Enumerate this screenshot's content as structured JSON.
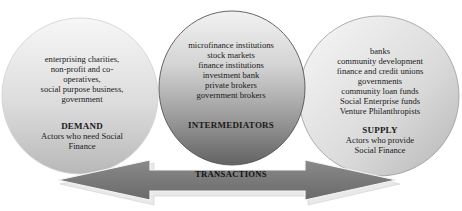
{
  "diagram": {
    "demand": {
      "items": [
        "enterprising charities,",
        "non-profit and co-",
        "operatives,",
        "social purpose business,",
        "government"
      ],
      "title": "DEMAND",
      "subtitle_lines": [
        "Actors who need Social",
        "Finance"
      ]
    },
    "intermediators": {
      "items": [
        "microfinance institutions",
        "stock markets",
        "finance institutions",
        "investment bank",
        "private brokers",
        "government brokers"
      ],
      "title": "INTERMEDIATORS"
    },
    "supply": {
      "items": [
        "banks",
        "community development",
        "finance and credit unions",
        "governments",
        "community loan funds",
        "Social Enterprise funds",
        "Venture Philanthropists"
      ],
      "title": "SUPPLY",
      "subtitle_lines": [
        "Actors who provide",
        "Social Finance"
      ]
    },
    "arrow": {
      "label": "TRANSACTIONS",
      "direction": "bidirectional"
    },
    "colors": {
      "side_circle_light": "#f4f4f4",
      "side_circle_dark": "#bdbdbd",
      "middle_circle_light": "#f0f0f0",
      "middle_circle_dark": "#6e6e6e",
      "arrow_fill": "#7a7a7a",
      "arrow_highlight": "#e8e8e8"
    }
  }
}
